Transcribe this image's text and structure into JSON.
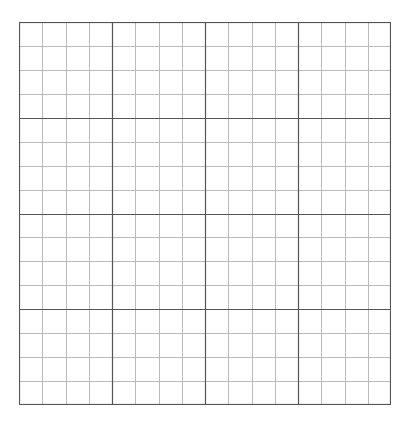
{
  "grid": {
    "major_divisions_x": 4,
    "major_divisions_y": 4,
    "minor_per_major": 4,
    "width": 372,
    "height": 383,
    "major_color": "#555555",
    "minor_color": "#bbbbbb",
    "border_color": "#555555",
    "background": "#ffffff"
  }
}
